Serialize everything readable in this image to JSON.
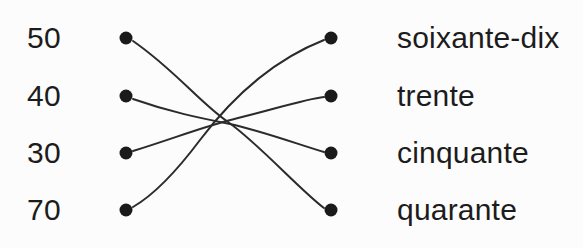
{
  "exercise": {
    "type": "matching-lines",
    "left_column": {
      "items": [
        {
          "label": "50",
          "y": 38
        },
        {
          "label": "40",
          "y": 96
        },
        {
          "label": "30",
          "y": 153
        },
        {
          "label": "70",
          "y": 210
        }
      ]
    },
    "right_column": {
      "items": [
        {
          "label": "soixante-dix",
          "y": 38
        },
        {
          "label": "trente",
          "y": 96
        },
        {
          "label": "cinquante",
          "y": 153
        },
        {
          "label": "quarante",
          "y": 210
        }
      ]
    },
    "connections": [
      {
        "from": "50",
        "to": "quarante",
        "path": "M 133 41 C 175 70 200 103 228 122 C 258 143 300 190 324 208"
      },
      {
        "from": "40",
        "to": "cinquante",
        "path": "M 133 99 C 170 112 200 118 230 124 C 262 131 300 145 324 152"
      },
      {
        "from": "30",
        "to": "trente",
        "path": "M 133 151 C 175 138 205 126 238 118 C 272 110 305 99 324 97"
      },
      {
        "from": "70",
        "to": "soixante-dix",
        "path": "M 133 207 C 152 196 176 172 200 140 C 228 103 268 62 324 40"
      }
    ],
    "dots": {
      "radius": 6.5,
      "color": "#1a1a1a",
      "left_x": 126,
      "right_x": 331
    },
    "colors": {
      "background": "#fcfcfc",
      "text": "#1c1c1c",
      "line": "#2b2b2b",
      "dot": "#1a1a1a"
    }
  }
}
